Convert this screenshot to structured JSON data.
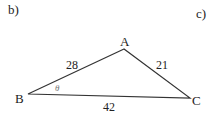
{
  "labels": {
    "part_b": "b)",
    "part_c": "c)"
  },
  "triangle": {
    "vertices": {
      "A": "A",
      "B": "B",
      "C": "C"
    },
    "sides": {
      "AB": "28",
      "AC": "21",
      "BC": "42"
    },
    "angle": "θ"
  }
}
